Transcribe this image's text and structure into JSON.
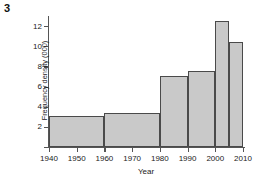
{
  "question_number": "3",
  "chart_data": {
    "type": "bar",
    "title": "",
    "xlabel": "Year",
    "ylabel": "Frequency density (000)",
    "xlim": [
      1940,
      2010
    ],
    "ylim": [
      0,
      13
    ],
    "grid": false,
    "legend": null,
    "xticks": [
      1940,
      1950,
      1960,
      1970,
      1980,
      1990,
      2000,
      2010
    ],
    "xtick_labels": [
      "1940",
      "1950",
      "1960",
      "1970",
      "1980",
      "1990",
      "2000",
      "2010"
    ],
    "yticks": [
      2,
      4,
      6,
      8,
      10,
      12
    ],
    "ytick_labels": [
      "2",
      "4",
      "6",
      "8",
      "10",
      "12"
    ],
    "bars": [
      {
        "label": "1940-1960",
        "x_start": 1940,
        "x_end": 1960,
        "value": 3.1
      },
      {
        "label": "1960-1980",
        "x_start": 1960,
        "x_end": 1980,
        "value": 3.4
      },
      {
        "label": "1980-1990",
        "x_start": 1980,
        "x_end": 1990,
        "value": 7.0
      },
      {
        "label": "1990-2000",
        "x_start": 1990,
        "x_end": 2000,
        "value": 7.5
      },
      {
        "label": "2000-2005",
        "x_start": 2000,
        "x_end": 2005,
        "value": 12.5
      },
      {
        "label": "2005-2010",
        "x_start": 2005,
        "x_end": 2010,
        "value": 10.4
      }
    ],
    "colors": {
      "bar_fill": "#c9c9c9",
      "bar_edge": "#4a4a4a",
      "axis": "#555555",
      "text": "#222222",
      "background": "#ffffff"
    }
  }
}
